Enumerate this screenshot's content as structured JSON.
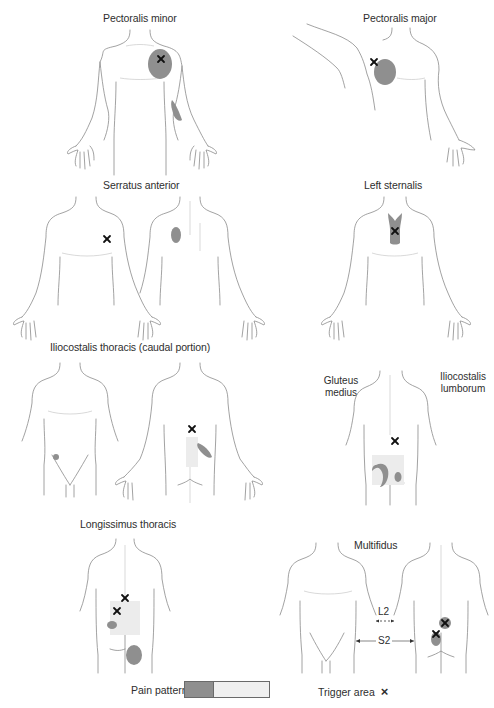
{
  "panels": {
    "pectoralis_minor": {
      "title": "Pectoralis minor",
      "view": "anterior",
      "trigger_points": 1,
      "pain_regions": [
        "upper chest",
        "ulnar forearm"
      ]
    },
    "pectoralis_major": {
      "title": "Pectoralis major",
      "view": "anterior (arm raised)",
      "trigger_points": 1,
      "pain_regions": [
        "lateral chest"
      ]
    },
    "serratus_anterior": {
      "title": "Serratus anterior",
      "views": [
        "anterior",
        "posterior"
      ],
      "trigger_points": 1,
      "pain_regions": [
        "medial scapula"
      ]
    },
    "left_sternalis": {
      "title": "Left sternalis",
      "view": "anterior",
      "trigger_points": 1,
      "pain_regions": [
        "sternum"
      ]
    },
    "iliocostalis_thoracis": {
      "title": "Iliocostalis thoracis (caudal portion)",
      "views": [
        "anterior",
        "posterior"
      ],
      "trigger_points": 1,
      "pain_regions": [
        "lower abdomen",
        "lateral lumbar"
      ]
    },
    "gluteus_iliocostalis": {
      "title_left": "Gluteus medius",
      "title_right": "Iliocostalis lumborum",
      "view": "posterior",
      "trigger_points": 1,
      "pain_regions": [
        "buttock crescent",
        "sacral spot"
      ]
    },
    "longissimus_thoracis": {
      "title": "Longissimus thoracis",
      "view": "posterior",
      "trigger_points": 2,
      "pain_regions": [
        "lumbar",
        "buttock"
      ]
    },
    "multifidus": {
      "title": "Multifidus",
      "views": [
        "anterior",
        "posterior"
      ],
      "trigger_points": 2,
      "labels": {
        "l2": "L2",
        "s2": "S2"
      }
    }
  },
  "legend": {
    "pain_pattern_label": "Pain pattern",
    "trigger_area_label": "Trigger area",
    "trigger_symbol": "×",
    "colors": {
      "pain_dark": "#8f8f8f",
      "pain_light": "#f0f0f0",
      "outline": "#8a8a8a"
    }
  }
}
